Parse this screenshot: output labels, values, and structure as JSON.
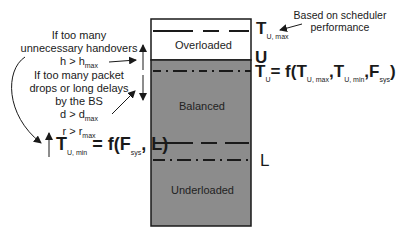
{
  "diagram": {
    "zones": {
      "overloaded": "Overloaded",
      "balanced": "Balanced",
      "underloaded": "Underloaded"
    },
    "thresholds": {
      "t_u_max": {
        "main": "T",
        "sub": "U, max"
      },
      "u_label": "U",
      "t_u": {
        "main": "T",
        "sub": "U",
        "eq": "= f(",
        "arg1": "T",
        "arg1_sub": "U, max",
        "comma1": ",",
        "arg2": "T",
        "arg2_sub": "U, min",
        "comma2": ",",
        "arg3": "F",
        "arg3_sub": "sys",
        "close": ")"
      },
      "l_label": "L",
      "t_u_min": {
        "main": "T",
        "sub": "U, min",
        "eq": "= f(F",
        "eq_sub": "sys",
        "tail": ", L)"
      }
    },
    "annotations": {
      "scheduler_line1": "Based on scheduler",
      "scheduler_line2": "performance",
      "handover_line1": "If too many",
      "handover_line2": "unnecessary handovers",
      "handover_cond": "h > h",
      "handover_cond_sub": "max",
      "packet_line1": "If  too many packet",
      "packet_line2": "drops or long delays",
      "packet_line3": "by the BS",
      "delay_cond": "d > d",
      "delay_cond_sub": "max",
      "rate_cond": "r > r",
      "rate_cond_sub": "max"
    },
    "colors": {
      "overloaded_fill": "#ffffff",
      "loaded_fill": "#8c8c8c",
      "border": "#1a1a1a"
    }
  }
}
